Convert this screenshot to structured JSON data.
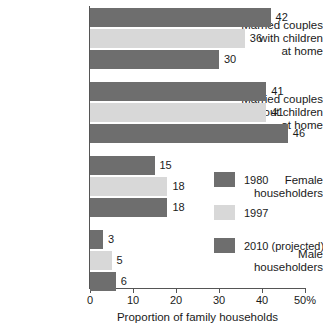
{
  "chart_data": {
    "type": "bar",
    "orientation": "horizontal",
    "title": "",
    "xlabel": "Proportion of family households",
    "ylabel": "",
    "xlim": [
      0,
      50
    ],
    "xticks": [
      0,
      10,
      20,
      30,
      40,
      50
    ],
    "xtick_labels": [
      "0",
      "10",
      "20",
      "30",
      "40",
      "50%"
    ],
    "grid": false,
    "legend_position": "center-right",
    "categories": [
      "Married couples with children at home",
      "Married couples without children at home",
      "Female householders",
      "Male householders"
    ],
    "category_label_lines": [
      [
        "Married couples",
        "with children",
        "at home"
      ],
      [
        "Married couples",
        "without children",
        "at home"
      ],
      [
        "Female",
        "householders"
      ],
      [
        "Male",
        "householders"
      ]
    ],
    "series": [
      {
        "name": "1980",
        "color": "#6e6e6e",
        "values": [
          42,
          41,
          15,
          3
        ]
      },
      {
        "name": "1997",
        "color": "#d8d8d8",
        "values": [
          36,
          41,
          18,
          5
        ]
      },
      {
        "name": "2010 (projected)",
        "color": "#6e6e6e",
        "values": [
          30,
          46,
          18,
          6
        ]
      }
    ]
  },
  "axis": {
    "x_title": "Proportion of family households",
    "tick_labels": [
      "0",
      "10",
      "20",
      "30",
      "40",
      "50%"
    ]
  },
  "legend": {
    "items": [
      {
        "label": "1980"
      },
      {
        "label": "1997"
      },
      {
        "label": "2010 (projected)"
      }
    ]
  },
  "groups": [
    {
      "lines": [
        "Married couples",
        "with children",
        "at home"
      ],
      "bars": [
        {
          "value": 42,
          "label": "42",
          "series": "1980"
        },
        {
          "value": 36,
          "label": "36",
          "series": "1997"
        },
        {
          "value": 30,
          "label": "30",
          "series": "2010 (projected)"
        }
      ]
    },
    {
      "lines": [
        "Married couples",
        "without children",
        "at home"
      ],
      "bars": [
        {
          "value": 41,
          "label": "41",
          "series": "1980"
        },
        {
          "value": 41,
          "label": "41",
          "series": "1997"
        },
        {
          "value": 46,
          "label": "46",
          "series": "2010 (projected)"
        }
      ]
    },
    {
      "lines": [
        "Female",
        "householders"
      ],
      "bars": [
        {
          "value": 15,
          "label": "15",
          "series": "1980"
        },
        {
          "value": 18,
          "label": "18",
          "series": "1997"
        },
        {
          "value": 18,
          "label": "18",
          "series": "2010 (projected)"
        }
      ]
    },
    {
      "lines": [
        "Male",
        "householders"
      ],
      "bars": [
        {
          "value": 3,
          "label": "3",
          "series": "1980"
        },
        {
          "value": 5,
          "label": "5",
          "series": "1997"
        },
        {
          "value": 6,
          "label": "6",
          "series": "2010 (projected)"
        }
      ]
    }
  ]
}
